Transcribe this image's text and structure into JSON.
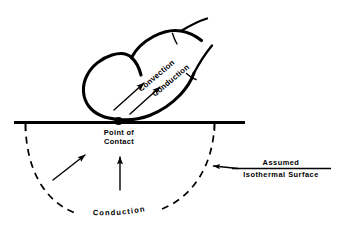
{
  "figure": {
    "background_color": "#ffffff",
    "ink_color": "#000000",
    "width": 339,
    "height": 231
  },
  "labels": {
    "convection": "Convection",
    "conduction_finger": "Conduction",
    "point_of_contact_line1": "Point  of",
    "point_of_contact_line2": "Contact",
    "conduction_arc": "Conduction",
    "assumed": "Assumed",
    "isothermal_surface": "Isothermal  Surface"
  },
  "elements": {
    "contact_dot": "filled-contact-point",
    "ground": "solid-horizontal-surface-line",
    "arc": "dashed-semicircular-isotherm",
    "finger": "finger-outline-touching-surface",
    "flow_arrows": "two-parallel-heat-flow-arrows-in-finger",
    "substrate_arrows": "two-conduction-arrows-below-surface",
    "leader": "leader-line-with-arrowhead-to-arc"
  }
}
